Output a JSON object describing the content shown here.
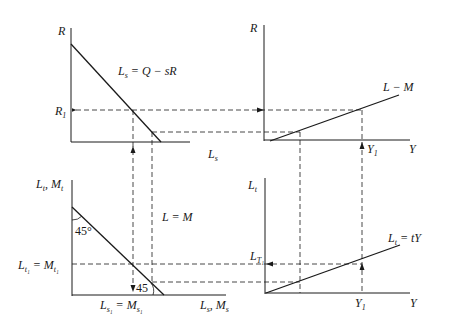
{
  "diagram": {
    "panels": {
      "top_left": {
        "y_axis_label": "R",
        "x_axis_label": "L_s",
        "curve_label": "L_s = Q − sR",
        "marker_label": "R_1"
      },
      "top_right": {
        "y_axis_label": "R",
        "x_axis_label": "Y",
        "curve_label": "L − M",
        "marker_label": "Y_1"
      },
      "bottom_left": {
        "y_axis_label": "L_t, M_t",
        "x_axis_label": "L_s, M_s",
        "curve_label": "L = M",
        "angle_top": "45°",
        "angle_bottom": "45°",
        "y_marker_label": "L_t1 = M_t1",
        "x_marker_label": "L_s1 = M_s1"
      },
      "bottom_right": {
        "y_axis_label": "L_t",
        "x_axis_label": "Y",
        "curve_label": "L_t = tY",
        "y_marker_label": "L_T1",
        "x_marker_label": "Y_1"
      }
    },
    "labels": {
      "tl_R": "R",
      "tl_Ls": "L",
      "tl_Ls_sub": "s",
      "tl_eq_L": "L",
      "tl_eq_sub": "s",
      "tl_eq_rest": " = Q − sR",
      "tl_R1": "R",
      "tl_R1_sub": "1",
      "tr_R": "R",
      "tr_Y": "Y",
      "tr_LM": "L − M",
      "tr_Y1": "Y",
      "tr_Y1_sub": "1",
      "bl_y_L": "L",
      "bl_y_Lsub": "t",
      "bl_y_M": ", M",
      "bl_y_Msub": "t",
      "bl_x_L": "L",
      "bl_x_Lsub": "s",
      "bl_x_M": ", M",
      "bl_x_Msub": "s",
      "bl_LM": "L = M",
      "bl_45a": "45°",
      "bl_45b": "45",
      "bl_Lt1_L": "L",
      "bl_Lt1_sub": "t₁",
      "bl_Lt1_M": " = M",
      "bl_Lt1_Msub": "t₁",
      "bl_Ls1_L": "L",
      "bl_Ls1_sub": "s₁",
      "bl_Ls1_M": " = M",
      "bl_Ls1_Msub": "s₁",
      "br_Lt": "L",
      "br_Lt_sub": "t",
      "br_Y": "Y",
      "br_eq_L": "L",
      "br_eq_sub": "t",
      "br_eq_rest": " = tY",
      "br_LT1": "L",
      "br_LT1_sub": "T₁",
      "br_Y1": "Y",
      "br_Y1_sub": "1"
    },
    "colors": {
      "ink": "#1a1a1a",
      "background": "#ffffff"
    }
  }
}
